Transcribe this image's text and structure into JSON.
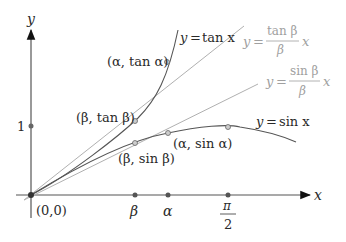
{
  "figure": {
    "axes": {
      "x_label": "x",
      "y_label": "y",
      "origin_label": "(0,0)",
      "y_tick_label": "1",
      "x_ticks": [
        {
          "label": "β",
          "name": "beta"
        },
        {
          "label": "α",
          "name": "alpha"
        },
        {
          "label_num": "π",
          "label_den": "2",
          "name": "pi-over-2"
        }
      ]
    },
    "curves": {
      "tan": {
        "label_lhs": "y",
        "label_eq": "=",
        "label_rhs": "tan x"
      },
      "sin": {
        "label_lhs": "y",
        "label_eq": "=",
        "label_rhs": "sin x"
      },
      "tan_secant": {
        "label_lhs": "y",
        "label_eq": "=",
        "label_num": "tan β",
        "label_den": "β",
        "label_var": "x"
      },
      "sin_secant": {
        "label_lhs": "y",
        "label_eq": "=",
        "label_num": "sin β",
        "label_den": "β",
        "label_var": "x"
      }
    },
    "points": {
      "alpha_tan": "(α, tan α)",
      "beta_tan": "(β, tan β)",
      "alpha_sin": "(α, sin α)",
      "beta_sin": "(β, sin β)"
    },
    "colors": {
      "curve": "#555555",
      "secant": "#b0b0b0",
      "axis": "#444444",
      "point_fill": "#bdbdbd",
      "faded_text": "#a0a0a0"
    }
  }
}
